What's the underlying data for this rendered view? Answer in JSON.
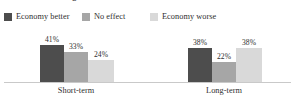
{
  "headline": {
    "text": "short-term and long-term effects"
  },
  "legend": {
    "items": [
      {
        "label": "Economy better",
        "color": "#4d4d4d",
        "icon": "legend-swatch-icon"
      },
      {
        "label": "No effect",
        "color": "#a6a6a6",
        "icon": "legend-swatch-icon"
      },
      {
        "label": "Economy worse",
        "color": "#d9d9d9",
        "icon": "legend-swatch-icon"
      }
    ]
  },
  "axis": {
    "categories": [
      "Short-term",
      "Long-term"
    ]
  },
  "bars": [
    {
      "value_label": "41%",
      "color": "#4d4d4d",
      "left": 40,
      "width": 24,
      "height": 38,
      "group": "Short-term",
      "series": "Economy better"
    },
    {
      "value_label": "33%",
      "color": "#a6a6a6",
      "left": 64,
      "width": 24,
      "height": 31,
      "group": "Short-term",
      "series": "No effect"
    },
    {
      "value_label": "24%",
      "color": "#d9d9d9",
      "left": 88,
      "width": 26,
      "height": 23,
      "group": "Short-term",
      "series": "Economy worse"
    },
    {
      "value_label": "38%",
      "color": "#4d4d4d",
      "left": 188,
      "width": 24,
      "height": 35,
      "group": "Long-term",
      "series": "Economy better"
    },
    {
      "value_label": "22%",
      "color": "#a6a6a6",
      "left": 212,
      "width": 24,
      "height": 21,
      "group": "Long-term",
      "series": "No effect"
    },
    {
      "value_label": "38%",
      "color": "#d9d9d9",
      "left": 236,
      "width": 26,
      "height": 35,
      "group": "Long-term",
      "series": "Economy worse"
    }
  ],
  "category_positions": [
    76,
    224
  ],
  "chart_data": {
    "type": "bar",
    "title": "short-term and long-term effects",
    "xlabel": "",
    "ylabel": "",
    "categories": [
      "Short-term",
      "Long-term"
    ],
    "series": [
      {
        "name": "Economy better",
        "values": [
          41,
          33
        ],
        "color": "#4d4d4d"
      },
      {
        "name": "No effect",
        "values": [
          33,
          22
        ],
        "color": "#a6a6a6"
      },
      {
        "name": "Economy worse",
        "values": [
          24,
          38
        ],
        "color": "#d9d9d9"
      }
    ],
    "series_corrected": [
      {
        "name": "Economy better",
        "values": [
          41,
          38
        ],
        "color": "#4d4d4d"
      },
      {
        "name": "No effect",
        "values": [
          33,
          22
        ],
        "color": "#a6a6a6"
      },
      {
        "name": "Economy worse",
        "values": [
          24,
          38
        ],
        "color": "#d9d9d9"
      }
    ],
    "value_labels": [
      [
        "41%",
        "33%",
        "24%"
      ],
      [
        "38%",
        "22%",
        "38%"
      ]
    ],
    "units": "percent",
    "ylim": [
      0,
      45
    ],
    "grid": false,
    "legend_position": "top-left",
    "data_labels": true
  }
}
